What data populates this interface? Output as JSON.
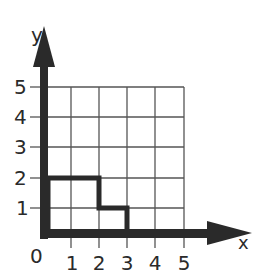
{
  "diagram": {
    "type": "coordinate-grid",
    "axes": {
      "x_label": "x",
      "y_label": "y",
      "origin_label": "0",
      "x_ticks": [
        "1",
        "2",
        "3",
        "4",
        "5"
      ],
      "y_ticks": [
        "1",
        "2",
        "3",
        "4",
        "5"
      ]
    },
    "grid": {
      "x_range": [
        0,
        5
      ],
      "y_range": [
        0,
        5
      ]
    },
    "shape": {
      "description": "Staircase polygon outlined in thick black",
      "vertices": [
        [
          0,
          0
        ],
        [
          0,
          2
        ],
        [
          2,
          2
        ],
        [
          2,
          1
        ],
        [
          3,
          1
        ],
        [
          3,
          0
        ]
      ]
    },
    "colors": {
      "ink": "#2a2a2a",
      "grid": "#555555",
      "background": "#ffffff"
    }
  }
}
